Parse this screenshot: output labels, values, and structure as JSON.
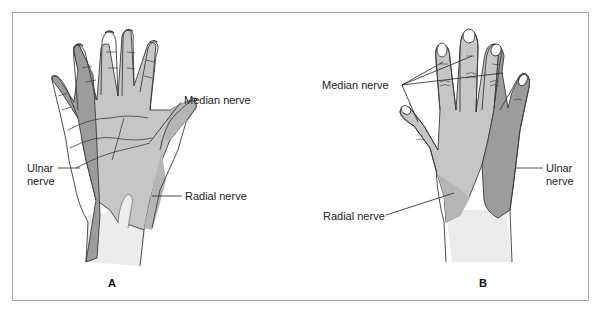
{
  "figure": {
    "panels": [
      {
        "id": "A",
        "view": "palmar",
        "letter": "A",
        "labels": {
          "median": "Median nerve",
          "ulnar_line1": "Ulnar",
          "ulnar_line2": "nerve",
          "radial": "Radial nerve"
        }
      },
      {
        "id": "B",
        "view": "dorsal",
        "letter": "B",
        "labels": {
          "median": "Median nerve",
          "ulnar_line1": "Ulnar",
          "ulnar_line2": "nerve",
          "radial": "Radial nerve"
        }
      }
    ],
    "colors": {
      "ulnar": "#9c9c9c",
      "median": "#c6c6c6",
      "radial": "#b6b6b6",
      "wrist": "#ececec",
      "outline": "#3a3a3a",
      "frame": "#a8a8a8"
    }
  }
}
